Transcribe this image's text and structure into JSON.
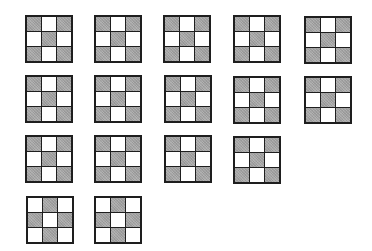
{
  "figure": {
    "colors": {
      "shaded": "#a9a9a9",
      "empty": "#ffffff",
      "border": "#1e1e1e"
    },
    "patterns": {
      "x": [
        1,
        0,
        1,
        0,
        1,
        0,
        1,
        0,
        1
      ],
      "plus_edges": [
        0,
        1,
        0,
        1,
        0,
        1,
        0,
        1,
        0
      ]
    },
    "grids": [
      {
        "row": 1,
        "col": 1,
        "x": 25,
        "y": 15,
        "pattern": "x"
      },
      {
        "row": 1,
        "col": 2,
        "x": 94,
        "y": 15,
        "pattern": "x"
      },
      {
        "row": 1,
        "col": 3,
        "x": 163,
        "y": 15,
        "pattern": "x"
      },
      {
        "row": 1,
        "col": 4,
        "x": 233,
        "y": 15,
        "pattern": "x"
      },
      {
        "row": 1,
        "col": 5,
        "x": 304,
        "y": 16,
        "pattern": "x"
      },
      {
        "row": 2,
        "col": 1,
        "x": 25,
        "y": 75,
        "pattern": "x"
      },
      {
        "row": 2,
        "col": 2,
        "x": 94,
        "y": 75,
        "pattern": "x"
      },
      {
        "row": 2,
        "col": 3,
        "x": 164,
        "y": 75,
        "pattern": "x"
      },
      {
        "row": 2,
        "col": 4,
        "x": 233,
        "y": 76,
        "pattern": "x"
      },
      {
        "row": 2,
        "col": 5,
        "x": 304,
        "y": 76,
        "pattern": "x"
      },
      {
        "row": 3,
        "col": 1,
        "x": 25,
        "y": 135,
        "pattern": "x"
      },
      {
        "row": 3,
        "col": 2,
        "x": 94,
        "y": 135,
        "pattern": "x"
      },
      {
        "row": 3,
        "col": 3,
        "x": 164,
        "y": 135,
        "pattern": "x"
      },
      {
        "row": 3,
        "col": 4,
        "x": 233,
        "y": 136,
        "pattern": "x"
      },
      {
        "row": 4,
        "col": 1,
        "x": 26,
        "y": 196,
        "pattern": "plus_edges"
      },
      {
        "row": 4,
        "col": 2,
        "x": 94,
        "y": 196,
        "pattern": "plus_edges"
      }
    ]
  }
}
